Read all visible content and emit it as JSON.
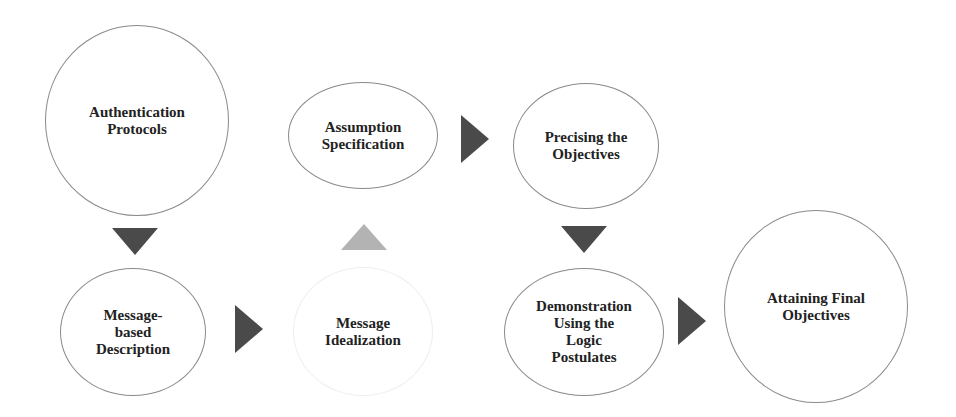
{
  "diagram": {
    "type": "process-flow",
    "nodes": [
      {
        "id": "n1",
        "label": "Authentication\nProtocols"
      },
      {
        "id": "n2",
        "label": "Message-\nbased\nDescription"
      },
      {
        "id": "n3",
        "label": "Message\nIdealization"
      },
      {
        "id": "n4",
        "label": "Assumption\nSpecification"
      },
      {
        "id": "n5",
        "label": "Precising the\nObjectives"
      },
      {
        "id": "n6",
        "label": "Demonstration\nUsing the\nLogic\nPostulates"
      },
      {
        "id": "n7",
        "label": "Attaining Final\nObjectives"
      }
    ],
    "edges": [
      {
        "from": "n1",
        "to": "n2",
        "direction": "down",
        "color": "#4a4a4a"
      },
      {
        "from": "n2",
        "to": "n3",
        "direction": "right",
        "color": "#4a4a4a"
      },
      {
        "from": "n3",
        "to": "n4",
        "direction": "up",
        "color": "#b3b3b3"
      },
      {
        "from": "n4",
        "to": "n5",
        "direction": "right",
        "color": "#4a4a4a"
      },
      {
        "from": "n5",
        "to": "n6",
        "direction": "down",
        "color": "#4a4a4a"
      },
      {
        "from": "n6",
        "to": "n7",
        "direction": "right",
        "color": "#4a4a4a"
      }
    ]
  },
  "colors": {
    "arrow_dark": "#4a4a4a",
    "arrow_light": "#b3b3b3",
    "node_border": "#8a8a8a",
    "node_border_faint": "#eeeeee",
    "text": "#222222"
  }
}
